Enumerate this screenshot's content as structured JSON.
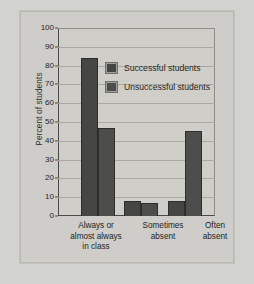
{
  "chart_data": {
    "type": "bar",
    "title": "",
    "xlabel": "",
    "ylabel": "Percent of students",
    "ylim": [
      0,
      100
    ],
    "ytick_step": 10,
    "yticks": [
      "0",
      "10",
      "20",
      "30",
      "40",
      "50",
      "60",
      "70",
      "80",
      "90",
      "100"
    ],
    "grid": true,
    "legend_position": "inside upper-center-right",
    "categories": [
      "Always or almost always in class",
      "Sometimes absent",
      "Often absent"
    ],
    "category_lines": [
      [
        "Always or",
        "almost always",
        "in class"
      ],
      [
        "Sometimes",
        "absent"
      ],
      [
        "Often",
        "absent"
      ]
    ],
    "series": [
      {
        "name": "Successful students",
        "color": "#454543",
        "values": [
          84,
          8,
          8
        ]
      },
      {
        "name": "Unsuccessful students",
        "color": "#4d4d4b",
        "values": [
          47,
          7,
          45
        ]
      }
    ]
  },
  "colors": {
    "page_background": "#d2d2ce",
    "panel_background": "#cecdc9",
    "plot_background": "#cfcec9",
    "axis": "#4a4a48",
    "gridline": "#a9a8a3",
    "bar_successful": "#454543",
    "bar_unsuccessful": "#4d4d4b",
    "text": "#232323"
  }
}
